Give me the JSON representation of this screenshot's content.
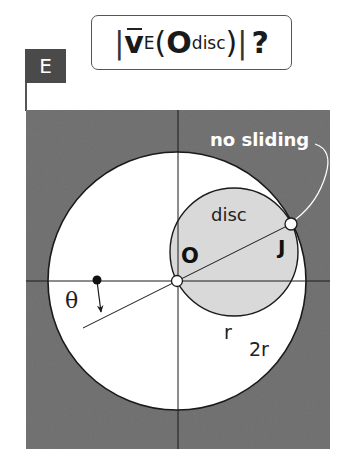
{
  "title": {
    "left_bar": "|",
    "vector": "v",
    "subscript_frame": "E",
    "open_paren": "(",
    "point": "O",
    "subscript_point": "disc",
    "close_paren": ")",
    "right_bar": "|",
    "question": "?"
  },
  "badge": {
    "label": "E"
  },
  "diagram": {
    "labels": {
      "no_sliding": "no sliding",
      "disc": "disc",
      "center_point": "O",
      "contact_point": "J",
      "angle": "θ",
      "disc_radius": "r",
      "ring_radius": "2r"
    },
    "colors": {
      "background_region": "#6e6e6e",
      "large_circle_fill": "#ffffff",
      "disc_fill": "#d9d9d9",
      "line": "#1a1a1a",
      "callout": "#ffffff"
    },
    "geometry": {
      "region": {
        "x": 26,
        "y": 110,
        "width": 304,
        "height": 339
      },
      "large_circle": {
        "cx": 177,
        "cy": 281,
        "r": 129
      },
      "disc": {
        "cx": 234,
        "cy": 252,
        "r": 64
      },
      "O": {
        "x": 177,
        "y": 281
      },
      "J": {
        "x": 291,
        "y": 224
      },
      "ref_point": {
        "x": 97,
        "y": 280
      }
    }
  }
}
